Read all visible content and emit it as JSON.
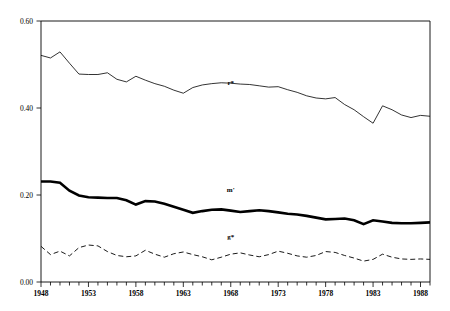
{
  "chart_data": {
    "type": "line",
    "title": "",
    "xlabel": "",
    "ylabel": "",
    "xlim": [
      1948,
      1989
    ],
    "ylim": [
      0.0,
      0.6
    ],
    "yticks": [
      0.0,
      0.2,
      0.4,
      0.6
    ],
    "ytick_labels": [
      "0.00",
      "0.20",
      "0.40",
      "0.60"
    ],
    "xticks": [
      1948,
      1953,
      1958,
      1963,
      1968,
      1973,
      1978,
      1983,
      1988
    ],
    "xtick_labels": [
      "1948",
      "1953",
      "1958",
      "1963",
      "1968",
      "1973",
      "1978",
      "1983",
      "1988"
    ],
    "xtick_minor_step": 1,
    "grid": false,
    "legend_position": "inline-annotations",
    "x": [
      1948,
      1949,
      1950,
      1951,
      1952,
      1953,
      1954,
      1955,
      1956,
      1957,
      1958,
      1959,
      1960,
      1961,
      1962,
      1963,
      1964,
      1965,
      1966,
      1967,
      1968,
      1969,
      1970,
      1971,
      1972,
      1973,
      1974,
      1975,
      1976,
      1977,
      1978,
      1979,
      1980,
      1981,
      1982,
      1983,
      1984,
      1985,
      1986,
      1987,
      1988,
      1989
    ],
    "series": [
      {
        "name": "r*",
        "style": "thin-solid",
        "color": "#000000",
        "line_width": 0.8,
        "label": "r*",
        "label_x": 1968,
        "label_y": 0.452,
        "values": [
          0.521,
          0.515,
          0.529,
          0.503,
          0.478,
          0.477,
          0.477,
          0.481,
          0.466,
          0.46,
          0.473,
          0.464,
          0.456,
          0.45,
          0.441,
          0.434,
          0.447,
          0.453,
          0.456,
          0.458,
          0.457,
          0.455,
          0.454,
          0.451,
          0.448,
          0.449,
          0.442,
          0.436,
          0.428,
          0.423,
          0.421,
          0.424,
          0.408,
          0.396,
          0.38,
          0.365,
          0.405,
          0.396,
          0.384,
          0.378,
          0.383,
          0.381
        ]
      },
      {
        "name": "m'",
        "style": "thick-solid",
        "color": "#000000",
        "line_width": 2.6,
        "label": "m'",
        "label_x": 1968,
        "label_y": 0.207,
        "values": [
          0.231,
          0.231,
          0.228,
          0.21,
          0.199,
          0.195,
          0.194,
          0.193,
          0.193,
          0.188,
          0.178,
          0.186,
          0.185,
          0.18,
          0.173,
          0.166,
          0.159,
          0.163,
          0.166,
          0.167,
          0.164,
          0.161,
          0.163,
          0.165,
          0.163,
          0.16,
          0.157,
          0.155,
          0.152,
          0.148,
          0.144,
          0.145,
          0.146,
          0.142,
          0.133,
          0.142,
          0.139,
          0.136,
          0.135,
          0.135,
          0.136,
          0.137
        ]
      },
      {
        "name": "g*",
        "style": "dashed",
        "color": "#000000",
        "line_width": 0.9,
        "dash": "5,3",
        "label": "g*",
        "label_x": 1968,
        "label_y": 0.098,
        "values": [
          0.082,
          0.063,
          0.071,
          0.06,
          0.079,
          0.085,
          0.083,
          0.07,
          0.061,
          0.058,
          0.06,
          0.073,
          0.064,
          0.057,
          0.065,
          0.069,
          0.063,
          0.058,
          0.051,
          0.057,
          0.064,
          0.067,
          0.062,
          0.058,
          0.063,
          0.071,
          0.066,
          0.06,
          0.057,
          0.061,
          0.07,
          0.068,
          0.061,
          0.055,
          0.048,
          0.052,
          0.064,
          0.057,
          0.053,
          0.052,
          0.053,
          0.052
        ]
      }
    ]
  },
  "axes": {
    "frame_color": "#000000",
    "tick_color": "#000000"
  }
}
